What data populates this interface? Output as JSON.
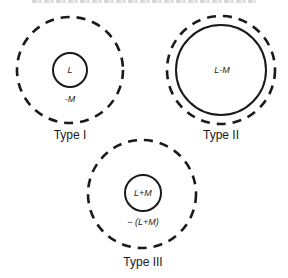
{
  "header": {
    "clipped_caption_visible": "partially cropped, illegible"
  },
  "diagram": {
    "colors": {
      "stroke": "#1a1a1a",
      "text": "#1a1a1a",
      "background": "#ffffff"
    },
    "panels": [
      {
        "id": "type-1",
        "type_label": "Type I",
        "inner_label": "L",
        "ring_label": "-M",
        "outer_circle": {
          "style": "dashed",
          "cx": 70,
          "cy": 70,
          "r": 53
        },
        "inner_circle": {
          "style": "solid",
          "cx": 70,
          "cy": 70,
          "r": 17
        }
      },
      {
        "id": "type-2",
        "type_label": "Type II",
        "inner_label": "L-M",
        "ring_label": "",
        "outer_circle": {
          "style": "dashed",
          "cx": 221,
          "cy": 70,
          "r": 55
        },
        "inner_circle": {
          "style": "solid",
          "cx": 221,
          "cy": 70,
          "r": 45
        }
      },
      {
        "id": "type-3",
        "type_label": "Type III",
        "inner_label": "L+M",
        "ring_label": "− (L+M)",
        "outer_circle": {
          "style": "dashed",
          "cx": 142,
          "cy": 194,
          "r": 55
        },
        "inner_circle": {
          "style": "solid",
          "cx": 143,
          "cy": 193,
          "r": 18
        }
      }
    ]
  }
}
